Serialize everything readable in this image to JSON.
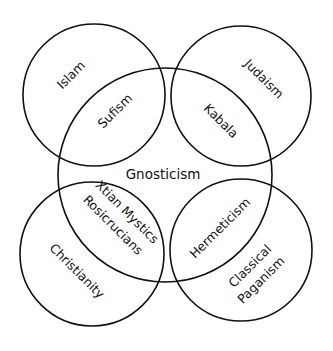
{
  "diagram": {
    "type": "venn",
    "stroke_color": "#111111",
    "background": "#ffffff",
    "circles": [
      {
        "name": "Islam",
        "cx": 94,
        "cy": 95,
        "r": 71
      },
      {
        "name": "Judaism",
        "cx": 241,
        "cy": 96,
        "r": 70
      },
      {
        "name": "Christianity",
        "cx": 92,
        "cy": 254,
        "r": 72
      },
      {
        "name": "Classical Paganism",
        "cx": 241,
        "cy": 250,
        "r": 71
      },
      {
        "name": "Gnosticism",
        "cx": 165,
        "cy": 175,
        "r": 107
      }
    ],
    "labels": {
      "islam": "Islam",
      "judaism": "Judaism",
      "christianity": "Christianity",
      "classical_line1": "Classical",
      "classical_line2": "Paganism",
      "gnosticism": "Gnosticism",
      "sufism": "Sufism",
      "kabala": "Kabala",
      "xtian_line1": "Xtian Mystics",
      "xtian_line2": "Rosicrucians",
      "hermeticism": "Hermeticism"
    }
  }
}
